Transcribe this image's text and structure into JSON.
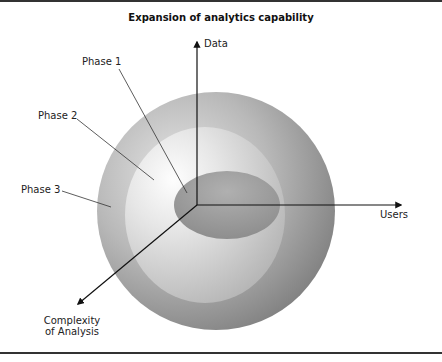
{
  "figure": {
    "title": "Expansion of analytics capability",
    "axes": {
      "vertical": "Data",
      "horizontal": "Users",
      "depth_line1": "Complexity",
      "depth_line2": "of Analysis"
    },
    "phases": [
      {
        "label": "Phase 1",
        "shape": "inner ellipse"
      },
      {
        "label": "Phase 2",
        "shape": "middle light sphere"
      },
      {
        "label": "Phase 3",
        "shape": "outer sphere"
      }
    ],
    "colors": {
      "outer_sphere_dark": "#7a7a7a",
      "outer_sphere_light": "#d8d8d8",
      "middle_highlight": "#ffffff",
      "inner_ellipse": "#9a9a9a",
      "axis": "#111111"
    }
  }
}
